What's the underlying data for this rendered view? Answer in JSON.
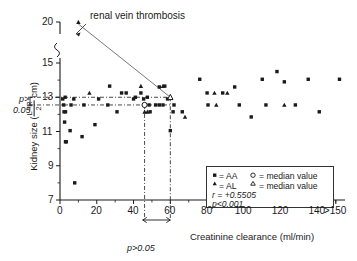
{
  "chart_data": {
    "type": "scatter",
    "title": "",
    "xlabel": "Creatinine clearance (ml/min)",
    "ylabel_prefix": "Kidney size (",
    "ylabel_num": "L+R",
    "ylabel_den": "2",
    "ylabel_unit": " cm)",
    "ylabel_suffix": ")",
    "xlim": [
      0,
      155
    ],
    "ylim": [
      7,
      20
    ],
    "xticks": [
      0,
      20,
      40,
      60,
      80,
      100,
      120,
      140,
      150
    ],
    "xticklabels": [
      "0",
      "20",
      "40",
      "60",
      "80",
      "100",
      "120",
      "140",
      ">150"
    ],
    "yticks": [
      7,
      9,
      11,
      13,
      15,
      20
    ],
    "yticklabels": [
      "7",
      "9",
      "11",
      "13",
      "15",
      "20"
    ],
    "y_axis_break_between": [
      15,
      20
    ],
    "grid": false,
    "legend_position": "lower-right",
    "annotation": "renal vein thrombosis",
    "annotation_marker": "triangle",
    "stat_r": "r=+0.5505",
    "stat_p": "p<0.001",
    "p_label_x": "p>0.05",
    "p_label_y_line1": "p>",
    "p_label_y_line2": "0.05",
    "median_line_y_AA": 12.55,
    "median_line_y_AL": 13.0,
    "median_line_x_AA": 46.0,
    "median_line_x_AL": 60.0,
    "p_bracket_x_range": [
      45,
      60
    ],
    "series": [
      {
        "name": "AA",
        "marker": "filled-square",
        "legend": "= AA",
        "points": [
          [
            1.5,
            12.9
          ],
          [
            2.0,
            12.55
          ],
          [
            2.2,
            12.15
          ],
          [
            3.0,
            12.15
          ],
          [
            2.5,
            11.55
          ],
          [
            3.0,
            10.4
          ],
          [
            3.4,
            10.4
          ],
          [
            2.8,
            13.0
          ],
          [
            5.5,
            11.05
          ],
          [
            8.0,
            8.0
          ],
          [
            6.0,
            12.55
          ],
          [
            7.5,
            12.9
          ],
          [
            12.0,
            10.7
          ],
          [
            13.0,
            12.55
          ],
          [
            19.0,
            11.4
          ],
          [
            21.0,
            12.9
          ],
          [
            26.0,
            12.55
          ],
          [
            27.0,
            13.65
          ],
          [
            31.0,
            12.15
          ],
          [
            33.5,
            13.25
          ],
          [
            36.0,
            13.25
          ],
          [
            40.0,
            12.9
          ],
          [
            41.0,
            13.0
          ],
          [
            44.0,
            13.25
          ],
          [
            45.5,
            12.9
          ],
          [
            46.0,
            12.55
          ],
          [
            47.5,
            13.0
          ],
          [
            48.5,
            12.55
          ],
          [
            49.0,
            12.15
          ],
          [
            52.0,
            12.55
          ],
          [
            54.0,
            12.55
          ],
          [
            56.0,
            12.55
          ],
          [
            54.0,
            13.6
          ],
          [
            57.0,
            13.65
          ],
          [
            58.5,
            12.9
          ],
          [
            60.0,
            11.05
          ],
          [
            61.5,
            12.15
          ],
          [
            62.0,
            12.55
          ],
          [
            66.5,
            12.15
          ],
          [
            76.0,
            14.05
          ],
          [
            80.0,
            13.25
          ],
          [
            80.5,
            12.55
          ],
          [
            88.5,
            13.25
          ],
          [
            95.0,
            13.6
          ],
          [
            97.5,
            12.55
          ],
          [
            104.0,
            11.85
          ],
          [
            110.0,
            14.05
          ],
          [
            112.0,
            12.55
          ],
          [
            118.0,
            14.5
          ],
          [
            122.0,
            13.9
          ],
          [
            128.0,
            12.55
          ],
          [
            135.0,
            14.05
          ],
          [
            141.0,
            12.15
          ],
          [
            152.0,
            14.05
          ]
        ]
      },
      {
        "name": "AL",
        "marker": "filled-triangle",
        "legend": "= AL",
        "points": [
          [
            10.0,
            20.0
          ],
          [
            16.0,
            13.25
          ],
          [
            44.0,
            13.65
          ],
          [
            46.0,
            12.15
          ],
          [
            47.5,
            12.15
          ],
          [
            56.0,
            13.65
          ],
          [
            68.0,
            11.85
          ],
          [
            84.0,
            13.25
          ],
          [
            91.0,
            13.25
          ],
          [
            85.0,
            12.55
          ],
          [
            122.0,
            12.55
          ]
        ]
      },
      {
        "name": "median value AA",
        "marker": "open-circle",
        "legend": "= median value",
        "points": [
          [
            46.0,
            12.55
          ]
        ]
      },
      {
        "name": "median value AL",
        "marker": "open-triangle",
        "legend": "= median value",
        "points": [
          [
            60.0,
            13.0
          ]
        ]
      }
    ]
  },
  "legend": {
    "row1_marker": "filled-square",
    "row1_a": "= AA",
    "row1_marker2": "open-circle",
    "row1_b": "= median value",
    "row2_marker": "filled-triangle",
    "row2_a": "= AL",
    "row2_marker2": "open-triangle",
    "row2_b": "= median value",
    "row3": "r = +0.5505",
    "row4": "p<0.001"
  }
}
